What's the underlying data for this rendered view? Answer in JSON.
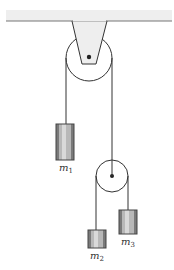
{
  "diagram": {
    "colors": {
      "ceiling_fill": "#eeeeee",
      "ceiling_edge": "#777777",
      "line": "#333333",
      "pulley_fill": "#ffffff",
      "axle": "#222222",
      "block_dark": "#7a7a7a",
      "block_mid": "#b8b8b8",
      "block_light": "#d9d9d9",
      "block_outline": "#444444"
    },
    "masses": [
      {
        "id": "m1",
        "symbol": "m",
        "subscript": "1"
      },
      {
        "id": "m2",
        "symbol": "m",
        "subscript": "2"
      },
      {
        "id": "m3",
        "symbol": "m",
        "subscript": "3"
      }
    ],
    "pulleys": [
      {
        "id": "upper-pulley",
        "role": "fixed"
      },
      {
        "id": "lower-pulley",
        "role": "movable"
      }
    ]
  }
}
